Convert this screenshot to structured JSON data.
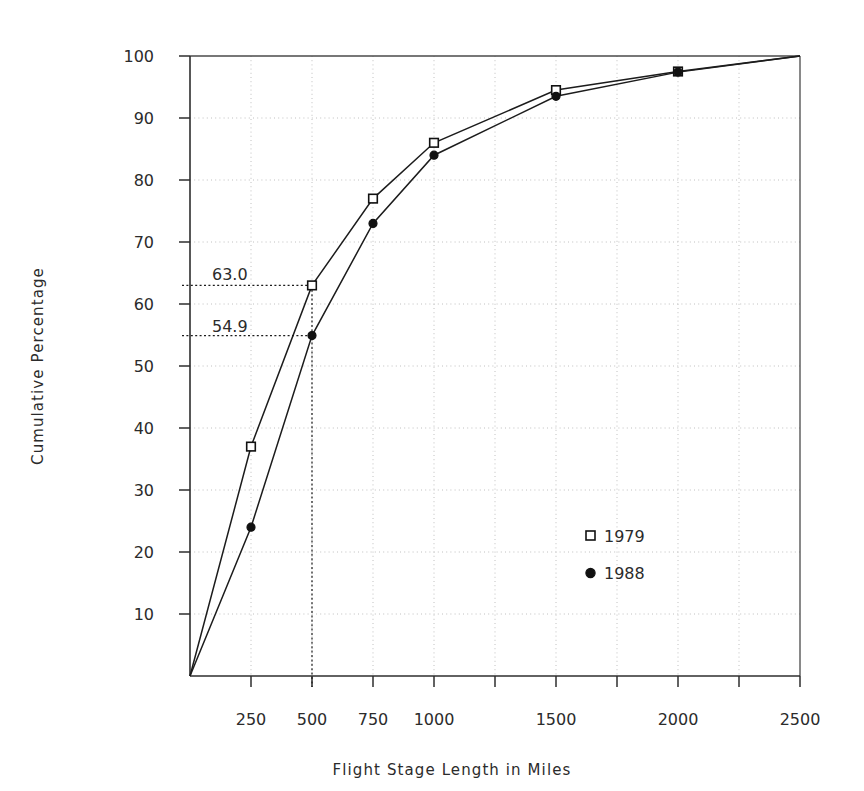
{
  "chart_data": {
    "type": "line",
    "title": "",
    "xlabel": "Flight Stage Length in Miles",
    "ylabel": "Cumulative Percentage",
    "xlim": [
      0,
      2500
    ],
    "ylim": [
      0,
      100
    ],
    "grid": true,
    "legend_position": "inside-lower-right",
    "x": [
      0,
      250,
      500,
      750,
      1000,
      1500,
      2000,
      2500
    ],
    "series": [
      {
        "name": "1979",
        "marker": "open-square",
        "values": [
          0,
          37.0,
          63.0,
          77.0,
          86.0,
          94.5,
          97.5,
          100.0
        ]
      },
      {
        "name": "1988",
        "marker": "filled-circle",
        "values": [
          0,
          24.0,
          54.9,
          73.0,
          84.0,
          93.5,
          97.4,
          100.0
        ]
      }
    ],
    "xticks_major": [
      250,
      500,
      750,
      1000,
      1500,
      2000,
      2500
    ],
    "xticks_all": [
      250,
      500,
      750,
      1000,
      1250,
      1500,
      1750,
      2000,
      2250,
      2500
    ],
    "xtick_labels": [
      "250",
      "500",
      "750",
      "1000",
      "1500",
      "2000",
      "2500"
    ],
    "yticks": [
      10,
      20,
      30,
      40,
      50,
      60,
      70,
      80,
      90,
      100
    ],
    "ytick_labels": [
      "10",
      "20",
      "30",
      "40",
      "50",
      "60",
      "70",
      "80",
      "90",
      "100"
    ],
    "annotations": [
      {
        "label": "63.0",
        "x": 500,
        "y": 63.0,
        "series": "1979",
        "leader": "horizontal-dotted-to-axis"
      },
      {
        "label": "54.9",
        "x": 500,
        "y": 54.9,
        "series": "1988",
        "leader": "horizontal-dotted-to-axis"
      },
      {
        "label": "",
        "x": 500,
        "y": 0,
        "series": "",
        "leader": "vertical-dotted-to-xaxis"
      }
    ],
    "gridlines_x": [
      250,
      500,
      750,
      1000,
      1250,
      1500,
      1750,
      2000,
      2250
    ],
    "gridlines_y": [
      10,
      20,
      30,
      40,
      50,
      60,
      70,
      80,
      90
    ]
  },
  "axis_titles": {
    "x": "Flight Stage Length in Miles",
    "y": "Cumulative Percentage"
  },
  "legend": {
    "entries": [
      {
        "label": "1979",
        "marker": "open-square"
      },
      {
        "label": "1988",
        "marker": "filled-circle"
      }
    ]
  },
  "annotation_labels": {
    "upper": "63.0",
    "lower": "54.9"
  },
  "colors": {
    "line": "#1c1c1c",
    "axis": "#2e2e2e",
    "grid": "#b9b9b9",
    "text": "#2b2b2b",
    "background": "#ffffff"
  }
}
